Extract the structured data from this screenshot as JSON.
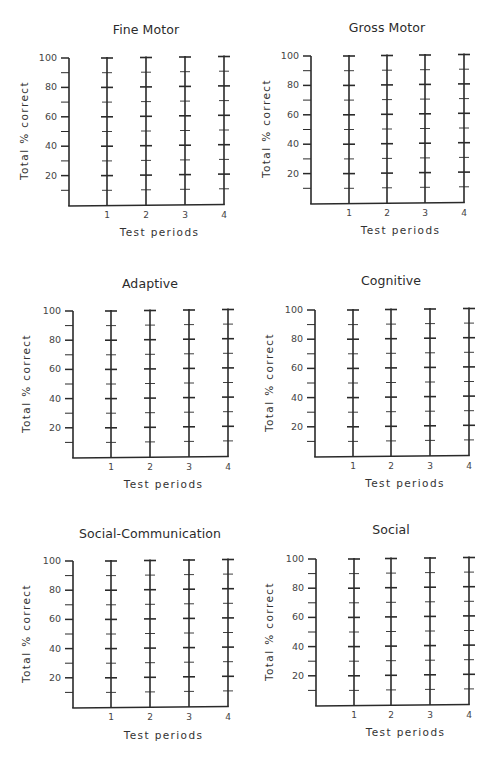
{
  "page": {
    "y_axis_label": "Total % correct",
    "x_axis_label": "Test periods"
  },
  "colors": {
    "line": "#2a2a2a",
    "text": "#333333",
    "background": "#ffffff"
  },
  "charts": [
    {
      "title": "Fine Motor"
    },
    {
      "title": "Gross Motor"
    },
    {
      "title": "Adaptive"
    },
    {
      "title": "Cognitive"
    },
    {
      "title": "Social-Communication"
    },
    {
      "title": "Social"
    }
  ],
  "chart_data": [
    {
      "type": "line",
      "title": "Fine Motor",
      "xlabel": "Test periods",
      "ylabel": "Total % correct",
      "categories": [
        "1",
        "2",
        "3",
        "4"
      ],
      "y_ticks": [
        20,
        40,
        60,
        80,
        100
      ],
      "minor_tick_step": 10,
      "ylim": [
        0,
        100
      ],
      "grid": false,
      "series": [],
      "note": "Blank record form; each test period has a vertical scale with major ticks every 20 and minor ticks every 10"
    },
    {
      "type": "line",
      "title": "Gross Motor",
      "xlabel": "Test periods",
      "ylabel": "Total % correct",
      "categories": [
        "1",
        "2",
        "3",
        "4"
      ],
      "y_ticks": [
        20,
        40,
        60,
        80,
        100
      ],
      "minor_tick_step": 10,
      "ylim": [
        0,
        100
      ],
      "grid": false,
      "series": []
    },
    {
      "type": "line",
      "title": "Adaptive",
      "xlabel": "Test periods",
      "ylabel": "Total % correct",
      "categories": [
        "1",
        "2",
        "3",
        "4"
      ],
      "y_ticks": [
        20,
        40,
        60,
        80,
        100
      ],
      "minor_tick_step": 10,
      "ylim": [
        0,
        100
      ],
      "grid": false,
      "series": []
    },
    {
      "type": "line",
      "title": "Cognitive",
      "xlabel": "Test periods",
      "ylabel": "Total % correct",
      "categories": [
        "1",
        "2",
        "3",
        "4"
      ],
      "y_ticks": [
        20,
        40,
        60,
        80,
        100
      ],
      "minor_tick_step": 10,
      "ylim": [
        0,
        100
      ],
      "grid": false,
      "series": []
    },
    {
      "type": "line",
      "title": "Social-Communication",
      "xlabel": "Test periods",
      "ylabel": "Total % correct",
      "categories": [
        "1",
        "2",
        "3",
        "4"
      ],
      "y_ticks": [
        20,
        40,
        60,
        80,
        100
      ],
      "minor_tick_step": 10,
      "ylim": [
        0,
        100
      ],
      "grid": false,
      "series": []
    },
    {
      "type": "line",
      "title": "Social",
      "xlabel": "Test periods",
      "ylabel": "Total % correct",
      "categories": [
        "1",
        "2",
        "3",
        "4"
      ],
      "y_ticks": [
        20,
        40,
        60,
        80,
        100
      ],
      "minor_tick_step": 10,
      "ylim": [
        0,
        100
      ],
      "grid": false,
      "series": []
    }
  ]
}
